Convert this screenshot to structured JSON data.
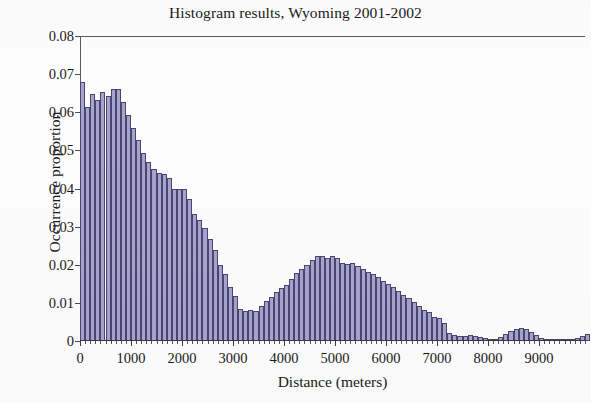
{
  "chart_data": {
    "type": "bar",
    "title": "Histogram results, Wyoming 2001-2002",
    "xlabel": "Distance (meters)",
    "ylabel": "Occurrence proportion",
    "xlim": [
      0,
      9900
    ],
    "ylim": [
      0,
      0.08
    ],
    "grid": false,
    "legend": null,
    "bin_width": 100,
    "x_tick_labels": [
      "0",
      "1000",
      "2000",
      "3000",
      "4000",
      "5000",
      "6000",
      "7000",
      "8000",
      "9000"
    ],
    "x_tick_values": [
      0,
      1000,
      2000,
      3000,
      4000,
      5000,
      6000,
      7000,
      8000,
      9000
    ],
    "y_tick_labels": [
      "0",
      "0.01",
      "0.02",
      "0.03",
      "0.04",
      "0.05",
      "0.06",
      "0.07",
      "0.08"
    ],
    "y_tick_values": [
      0,
      0.01,
      0.02,
      0.03,
      0.04,
      0.05,
      0.06,
      0.07,
      0.08
    ],
    "bar_color": "#a7a3ce",
    "bar_edge_color": "#4b4670",
    "x": [
      0,
      100,
      200,
      300,
      400,
      500,
      600,
      700,
      800,
      900,
      1000,
      1100,
      1200,
      1300,
      1400,
      1500,
      1600,
      1700,
      1800,
      1900,
      2000,
      2100,
      2200,
      2300,
      2400,
      2500,
      2600,
      2700,
      2800,
      2900,
      3000,
      3100,
      3200,
      3300,
      3400,
      3500,
      3600,
      3700,
      3800,
      3900,
      4000,
      4100,
      4200,
      4300,
      4400,
      4500,
      4600,
      4700,
      4800,
      4900,
      5000,
      5100,
      5200,
      5300,
      5400,
      5500,
      5600,
      5700,
      5800,
      5900,
      6000,
      6100,
      6200,
      6300,
      6400,
      6500,
      6600,
      6700,
      6800,
      6900,
      7000,
      7100,
      7200,
      7300,
      7400,
      7500,
      7600,
      7700,
      7800,
      7900,
      8000,
      8100,
      8200,
      8300,
      8400,
      8500,
      8600,
      8700,
      8800,
      8900,
      9000,
      9100,
      9200,
      9300,
      9400,
      9500,
      9600,
      9700,
      9800,
      9900
    ],
    "values": [
      0.068,
      0.0615,
      0.0648,
      0.0632,
      0.0652,
      0.0642,
      0.0662,
      0.066,
      0.0628,
      0.0592,
      0.056,
      0.0528,
      0.0492,
      0.047,
      0.0452,
      0.044,
      0.0438,
      0.0428,
      0.0398,
      0.04,
      0.0398,
      0.0372,
      0.0332,
      0.0318,
      0.0296,
      0.0268,
      0.024,
      0.02,
      0.0175,
      0.0142,
      0.0118,
      0.0084,
      0.008,
      0.0082,
      0.0078,
      0.0092,
      0.0104,
      0.0116,
      0.0128,
      0.014,
      0.0148,
      0.0162,
      0.0178,
      0.019,
      0.02,
      0.0212,
      0.0224,
      0.0222,
      0.0218,
      0.0222,
      0.0218,
      0.0204,
      0.0202,
      0.0204,
      0.0196,
      0.019,
      0.0182,
      0.0176,
      0.0168,
      0.0158,
      0.015,
      0.0142,
      0.0132,
      0.0122,
      0.0112,
      0.0102,
      0.0092,
      0.0082,
      0.0076,
      0.0062,
      0.006,
      0.0048,
      0.002,
      0.0016,
      0.0012,
      0.0014,
      0.0016,
      0.0012,
      0.001,
      0.0008,
      0.0006,
      0.0006,
      0.001,
      0.0018,
      0.0026,
      0.0032,
      0.0034,
      0.0032,
      0.0024,
      0.0016,
      0.0008,
      0.0004,
      0.0002,
      0.0002,
      0.0002,
      0.0004,
      0.0006,
      0.0008,
      0.0014,
      0.0018
    ]
  }
}
